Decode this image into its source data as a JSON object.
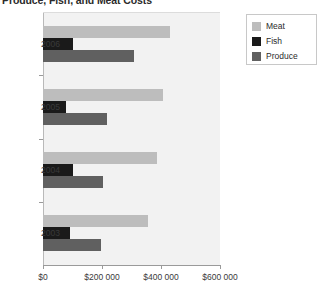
{
  "chart_data": {
    "type": "bar",
    "orientation": "horizontal",
    "title": "Produce, Fish, and Meat Costs",
    "xlabel": "",
    "ylabel": "",
    "categories": [
      "2006",
      "2005",
      "2004",
      "2003"
    ],
    "series": [
      {
        "name": "Meat",
        "color": "#bdbdbd",
        "values": [
          430000,
          408000,
          385000,
          355000
        ]
      },
      {
        "name": "Fish",
        "color": "#1a1a1a",
        "values": [
          100000,
          78000,
          103000,
          93000
        ]
      },
      {
        "name": "Produce",
        "color": "#606060",
        "values": [
          310000,
          218000,
          205000,
          195000
        ]
      }
    ],
    "xlim": [
      0,
      600000
    ],
    "xticks": [
      0,
      200000,
      400000,
      600000
    ],
    "xtick_labels": [
      "$0",
      "$200 000",
      "$400 000",
      "$600 000"
    ],
    "grid": false,
    "legend_position": "right",
    "plot_background": "#f2f2f2"
  },
  "legend": {
    "items": [
      {
        "label": "Meat",
        "color": "#bdbdbd"
      },
      {
        "label": "Fish",
        "color": "#1a1a1a"
      },
      {
        "label": "Produce",
        "color": "#606060"
      }
    ]
  }
}
